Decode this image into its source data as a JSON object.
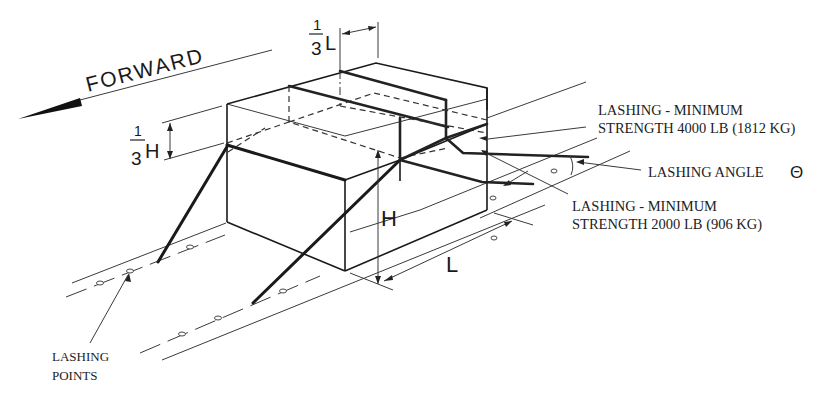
{
  "diagram": {
    "direction_label": "FORWARD",
    "dimension_labels": {
      "third_length_num": "1",
      "third_length_den": "3",
      "third_length_var": "L",
      "third_height_num": "1",
      "third_height_den": "3",
      "third_height_var": "H",
      "height": "H",
      "length": "L"
    },
    "callouts": {
      "lashing_4000_line1": "LASHING - MINIMUM",
      "lashing_4000_line2": "STRENGTH 4000 LB (1812 KG)",
      "lashing_angle": "LASHING ANGLE",
      "lashing_angle_symbol": "Θ",
      "lashing_2000_line1": "LASHING - MINIMUM",
      "lashing_2000_line2": "STRENGTH 2000 LB (906 KG)",
      "lashing_points_line1": "LASHING",
      "lashing_points_line2": "POINTS"
    },
    "colors": {
      "ink": "#1a1a1a",
      "background": "#ffffff"
    }
  }
}
